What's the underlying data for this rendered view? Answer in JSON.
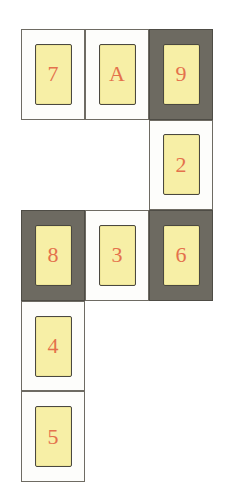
{
  "board": {
    "title": "card-grid-puzzle",
    "columns": 3,
    "rows": 5,
    "cell_width": 64,
    "cell_height": 90.6,
    "origin_x": 21,
    "origin_y": 29,
    "colors": {
      "background": "#ffffff",
      "cell_light": "#fdfdfb",
      "cell_dark": "#6d6a61",
      "cell_border": "#6e6b63",
      "card_fill": "#f7efa6",
      "card_border": "#4a4840",
      "card_text": "#e4714c"
    },
    "cells": [
      {
        "id": "cell-r1c1",
        "row": 1,
        "col": 1,
        "shade": "light",
        "has_card": true,
        "label": "7"
      },
      {
        "id": "cell-r1c2",
        "row": 1,
        "col": 2,
        "shade": "light",
        "has_card": true,
        "label": "A"
      },
      {
        "id": "cell-r1c3",
        "row": 1,
        "col": 3,
        "shade": "dark",
        "has_card": true,
        "label": "9"
      },
      {
        "id": "cell-r2c1",
        "row": 2,
        "col": 1,
        "shade": "none",
        "has_card": false,
        "label": ""
      },
      {
        "id": "cell-r2c2",
        "row": 2,
        "col": 2,
        "shade": "none",
        "has_card": false,
        "label": ""
      },
      {
        "id": "cell-r2c3",
        "row": 2,
        "col": 3,
        "shade": "light",
        "has_card": true,
        "label": "2"
      },
      {
        "id": "cell-r3c1",
        "row": 3,
        "col": 1,
        "shade": "dark",
        "has_card": true,
        "label": "8"
      },
      {
        "id": "cell-r3c2",
        "row": 3,
        "col": 2,
        "shade": "light",
        "has_card": true,
        "label": "3"
      },
      {
        "id": "cell-r3c3",
        "row": 3,
        "col": 3,
        "shade": "dark",
        "has_card": true,
        "label": "6"
      },
      {
        "id": "cell-r4c1",
        "row": 4,
        "col": 1,
        "shade": "light",
        "has_card": true,
        "label": "4"
      },
      {
        "id": "cell-r4c2",
        "row": 4,
        "col": 2,
        "shade": "none",
        "has_card": false,
        "label": ""
      },
      {
        "id": "cell-r4c3",
        "row": 4,
        "col": 3,
        "shade": "none",
        "has_card": false,
        "label": ""
      },
      {
        "id": "cell-r5c1",
        "row": 5,
        "col": 1,
        "shade": "light",
        "has_card": true,
        "label": "5"
      },
      {
        "id": "cell-r5c2",
        "row": 5,
        "col": 2,
        "shade": "none",
        "has_card": false,
        "label": ""
      },
      {
        "id": "cell-r5c3",
        "row": 5,
        "col": 3,
        "shade": "none",
        "has_card": false,
        "label": ""
      }
    ]
  }
}
